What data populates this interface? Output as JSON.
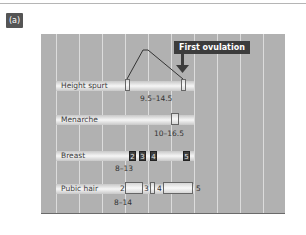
{
  "panel_label": "(a)",
  "callout": {
    "label": "First ovulation"
  },
  "tracks": {
    "height_spurt": {
      "label": "Height spurt",
      "range": "9.5–14.5"
    },
    "menarche": {
      "label": "Menarche",
      "range": "10–16.5"
    },
    "breast": {
      "label": "Breast",
      "range": "8–13",
      "stages": [
        "2",
        "3",
        "4",
        "5"
      ]
    },
    "pubic_hair": {
      "label": "Pubic hair",
      "range": "8–14",
      "stages": [
        "2",
        "3",
        "4",
        "5"
      ]
    }
  },
  "colors": {
    "chart_bg": "#b1b1b1",
    "grid": "#dcdcdc",
    "callout_bg": "#3c3c3c",
    "stage_dark": "#3e3e3e"
  }
}
